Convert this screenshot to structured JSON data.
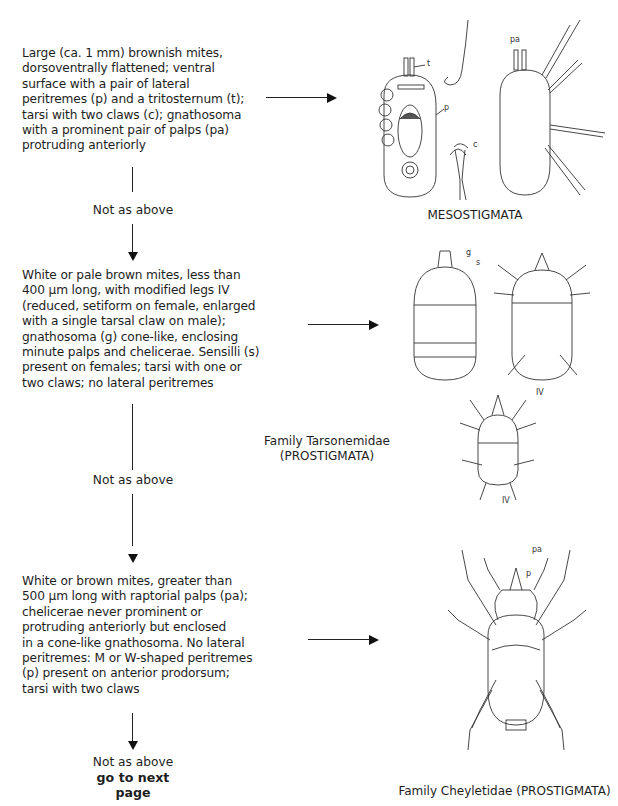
{
  "key_steps": [
    {
      "description": "Large (ca. 1 mm) brownish mites, dorsoventrally flattened; ventral surface with a pair of lateral peritremes (p) and a tritosternum (t); tarsi with two claws (c); gnathosoma with a prominent pair of palps (pa) protruding anteriorly",
      "lines": [
        "Large (ca. 1 mm) brownish mites,",
        "dorsoventrally flattened; ventral",
        "surface with a pair of lateral",
        "peritremes (p) and a tritosternum (t);",
        "tarsi with two claws (c); gnathosoma",
        "with a prominent pair of palps (pa)",
        "protruding anteriorly"
      ],
      "result": "MESOSTIGMATA",
      "figure_labels": [
        "t",
        "p",
        "c",
        "pa"
      ]
    },
    {
      "lines": [
        "White or pale brown mites, less than",
        "400 µm long, with modified legs IV",
        "(reduced, setiform on female, enlarged",
        "with a single tarsal claw on male);",
        "gnathosoma (g) cone-like, enclosing",
        "minute palps and chelicerae. Sensilli (s)",
        "present on females; tarsi with one or",
        "two claws; no lateral peritremes"
      ],
      "result_line1": "Family Tarsonemidae",
      "result_line2": "(PROSTIGMATA)",
      "figure_labels": [
        "g",
        "s",
        "IV",
        "IV"
      ]
    },
    {
      "lines": [
        "White or brown mites, greater than",
        "500 µm long with raptorial palps (pa);",
        "chelicerae never prominent or",
        "protruding anteriorly but enclosed",
        "in a cone-like gnathosoma. No lateral",
        "peritremes: M or W-shaped peritremes",
        "(p) present on anterior prodorsum;",
        "tarsi with two claws"
      ],
      "result": "Family Cheyletidae (PROSTIGMATA)",
      "figure_labels": [
        "pa",
        "p"
      ]
    }
  ],
  "branches": {
    "not_as_above": "Not as above",
    "go_next_line1": "go to next",
    "go_next_line2": "page"
  }
}
